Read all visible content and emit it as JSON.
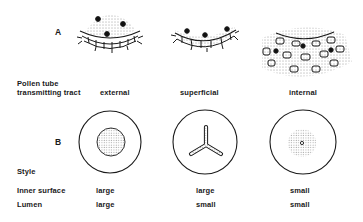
{
  "figure": {
    "panels": [
      {
        "id": "A",
        "label": "A"
      },
      {
        "id": "B",
        "label": "B"
      }
    ],
    "row_labels": {
      "pollen_tube_line1": "Pollen tube",
      "pollen_tube_line2": "transmitting tract",
      "style": "Style",
      "inner_surface": "Inner surface",
      "lumen": "Lumen"
    },
    "columns": [
      {
        "tract": "external",
        "inner_surface": "large",
        "lumen": "large"
      },
      {
        "tract": "superficial",
        "inner_surface": "large",
        "lumen": "small"
      },
      {
        "tract": "internal",
        "inner_surface": "small",
        "lumen": "small"
      }
    ],
    "colors": {
      "ink": "#1a1a1a",
      "background": "#ffffff"
    }
  }
}
